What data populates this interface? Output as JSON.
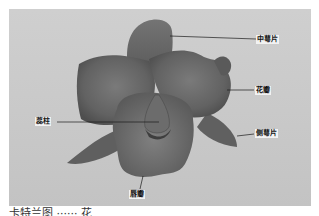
{
  "diagram": {
    "labels": [
      {
        "id": "dorsal-sepal",
        "text": "中萼片"
      },
      {
        "id": "petal",
        "text": "花瓣"
      },
      {
        "id": "lateral-sepal",
        "text": "侧萼片"
      },
      {
        "id": "column",
        "text": "蕊柱"
      },
      {
        "id": "lip",
        "text": "唇瓣"
      }
    ],
    "colors": {
      "background": "#c9c9c9",
      "flower_dark": "#4a4a4a",
      "flower_mid": "#6b6b6b",
      "flower_light": "#858585",
      "leader_line": "#1a1a1a"
    }
  },
  "caption": {
    "text": "卡特兰图 ······ 花"
  }
}
